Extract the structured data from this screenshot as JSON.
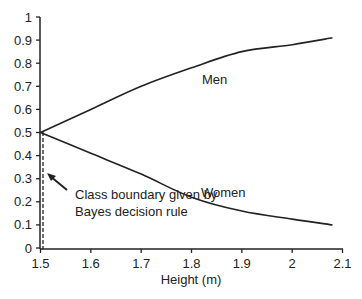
{
  "chart_data": {
    "type": "line",
    "title": "",
    "xlabel": "Height (m)",
    "ylabel": "",
    "xlim": [
      1.5,
      2.1
    ],
    "ylim": [
      0,
      1
    ],
    "grid": false,
    "legend": "none (inline labels)",
    "x_ticks": [
      "1.5",
      "1.6",
      "1.7",
      "1.8",
      "1.9",
      "2",
      "2.1"
    ],
    "y_ticks": [
      "0",
      "0.1",
      "0.2",
      "0.3",
      "0.4",
      "0.5",
      "0.6",
      "0.7",
      "0.8",
      "0.9",
      "1"
    ],
    "x": [
      1.5,
      1.6,
      1.7,
      1.8,
      1.9,
      2.0,
      2.08
    ],
    "series": [
      {
        "name": "Men",
        "values": [
          0.5,
          0.6,
          0.7,
          0.78,
          0.85,
          0.88,
          0.91
        ]
      },
      {
        "name": "Women",
        "values": [
          0.5,
          0.41,
          0.32,
          0.22,
          0.16,
          0.125,
          0.1
        ]
      }
    ],
    "annotations": [
      {
        "text": "Class boundary given by Bayes decision rule",
        "line1": "Class boundary given by",
        "line2": "Bayes decision rule",
        "x": 1.51,
        "style": "dashed vertical line with arrow"
      }
    ],
    "series_labels": {
      "men": "Men",
      "women": "Women"
    }
  }
}
